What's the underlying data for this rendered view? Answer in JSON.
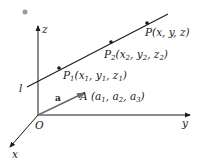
{
  "diagram": {
    "axes": {
      "z_label": "z",
      "y_label": "y",
      "x_label": "x",
      "origin_label": "O"
    },
    "line": {
      "label": "l",
      "points": [
        {
          "name": "P",
          "sub": "1",
          "coords": [
            "x",
            "1",
            "y",
            "1",
            "z",
            "1"
          ]
        },
        {
          "name": "P",
          "sub": "2",
          "coords": [
            "x",
            "2",
            "y",
            "2",
            "z",
            "2"
          ]
        },
        {
          "name": "P",
          "coords_text": "(x, y, z)"
        }
      ]
    },
    "vector": {
      "label": "a",
      "point_name": "A",
      "point_coords": [
        "a",
        "1",
        "a",
        "2",
        "a",
        "3"
      ]
    },
    "colors": {
      "line": "#1a1a1a",
      "vector": "#6b6b6b",
      "dot": "#999999"
    }
  }
}
